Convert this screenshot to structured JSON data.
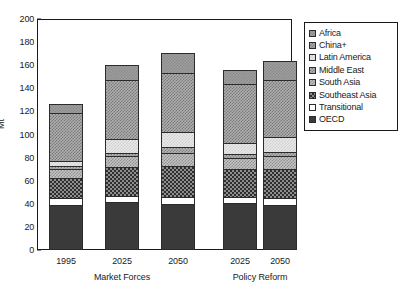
{
  "chart_data": {
    "type": "bar",
    "subtype": "stacked-bar",
    "title": "",
    "xlabel": "",
    "ylabel": "Mt",
    "ylim": [
      0,
      200
    ],
    "yticks": [
      0,
      20,
      40,
      60,
      80,
      100,
      120,
      140,
      160,
      180,
      200
    ],
    "grid": false,
    "legend_position": "right",
    "categories": [
      "1995",
      "2025",
      "2050",
      "2025",
      "2050"
    ],
    "groups": [
      {
        "label": "Market Forces",
        "categories": [
          "1995",
          "2025",
          "2050"
        ]
      },
      {
        "label": "Policy Reform",
        "categories": [
          "2025",
          "2050"
        ]
      }
    ],
    "series": [
      {
        "name": "OECD",
        "values": [
          39,
          42,
          40,
          41,
          39
        ]
      },
      {
        "name": "Transitional",
        "values": [
          6,
          5,
          6,
          5,
          6
        ]
      },
      {
        "name": "Southeast Asia",
        "values": [
          17,
          25,
          27,
          24,
          25
        ]
      },
      {
        "name": "South Asia",
        "values": [
          8,
          9,
          11,
          10,
          11
        ]
      },
      {
        "name": "Middle East",
        "values": [
          3,
          3,
          5,
          3,
          4
        ]
      },
      {
        "name": "Latin America",
        "values": [
          4,
          12,
          13,
          10,
          13
        ]
      },
      {
        "name": "China+",
        "values": [
          42,
          51,
          51,
          51,
          49
        ]
      },
      {
        "name": "Africa",
        "values": [
          7,
          13,
          18,
          12,
          17
        ]
      }
    ],
    "totals": [
      126,
      160,
      171,
      156,
      164
    ],
    "legend_entries": [
      {
        "label": "Africa",
        "swatch": "gray-dot"
      },
      {
        "label": "China+",
        "swatch": "gray-dot"
      },
      {
        "label": "Latin America",
        "swatch": "light-dot"
      },
      {
        "label": "Middle East",
        "swatch": "gray-dot"
      },
      {
        "label": "South Asia",
        "swatch": "gray-dot"
      },
      {
        "label": "Southeast Asia",
        "swatch": "crosshatch"
      },
      {
        "label": "Transitional",
        "swatch": "white"
      },
      {
        "label": "OECD",
        "swatch": "solid-dark"
      }
    ]
  },
  "colors": {
    "axis": "#1a1a1a",
    "oecd": "#3a3a3a",
    "transitional": "#ffffff",
    "southeast_asia": "#8e8e8e",
    "south_asia": "#c3c3c3",
    "middle_east": "#b5b5b5",
    "latin_america": "#e8e8e8",
    "china_plus": "#aeaeae",
    "africa": "#9d9d9d",
    "background": "#ffffff"
  }
}
